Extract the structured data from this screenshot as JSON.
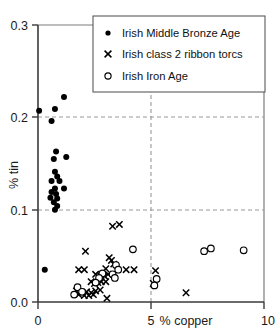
{
  "chart_data": {
    "type": "scatter",
    "title": "",
    "xlabel": "% copper",
    "ylabel": "% tin",
    "xlim": [
      0,
      10
    ],
    "ylim": [
      0.0,
      0.3
    ],
    "xticks": [
      0,
      5,
      10
    ],
    "xtick_labels": [
      "0",
      "5",
      "10"
    ],
    "yticks": [
      0.0,
      0.1,
      0.2,
      0.3
    ],
    "ytick_labels": [
      "0.0",
      "0.1",
      "0.2",
      "0.3"
    ],
    "grid": "dashed gridlines at y=0.1, y=0.2 and x=5",
    "legend_position": "top-center",
    "series": [
      {
        "name": "Irish Middle Bronze Age",
        "marker": "filled-circle",
        "color": "#000000",
        "points": [
          [
            0.05,
            0.207
          ],
          [
            0.6,
            0.196
          ],
          [
            0.75,
            0.209
          ],
          [
            1.15,
            0.222
          ],
          [
            0.8,
            0.163
          ],
          [
            0.7,
            0.155
          ],
          [
            1.25,
            0.157
          ],
          [
            0.75,
            0.141
          ],
          [
            0.85,
            0.136
          ],
          [
            0.6,
            0.131
          ],
          [
            0.95,
            0.131
          ],
          [
            0.75,
            0.123
          ],
          [
            1.15,
            0.123
          ],
          [
            0.6,
            0.119
          ],
          [
            0.8,
            0.117
          ],
          [
            0.85,
            0.112
          ],
          [
            0.55,
            0.113
          ],
          [
            0.7,
            0.108
          ],
          [
            0.85,
            0.104
          ],
          [
            0.75,
            0.1
          ],
          [
            0.3,
            0.035
          ]
        ]
      },
      {
        "name": "Irish class 2 ribbon torcs",
        "marker": "cross",
        "color": "#000000",
        "points": [
          [
            3.3,
            0.082
          ],
          [
            3.6,
            0.084
          ],
          [
            2.1,
            0.055
          ],
          [
            3.15,
            0.048
          ],
          [
            3.25,
            0.045
          ],
          [
            3.35,
            0.041
          ],
          [
            1.8,
            0.035
          ],
          [
            2.05,
            0.035
          ],
          [
            3.0,
            0.036
          ],
          [
            3.9,
            0.035
          ],
          [
            4.25,
            0.035
          ],
          [
            5.2,
            0.034
          ],
          [
            2.55,
            0.03
          ],
          [
            2.75,
            0.029
          ],
          [
            2.95,
            0.028
          ],
          [
            3.1,
            0.03
          ],
          [
            2.35,
            0.022
          ],
          [
            2.5,
            0.02
          ],
          [
            2.65,
            0.021
          ],
          [
            2.8,
            0.022
          ],
          [
            3.0,
            0.022
          ],
          [
            5.1,
            0.02
          ],
          [
            1.7,
            0.012
          ],
          [
            1.95,
            0.01
          ],
          [
            2.15,
            0.011
          ],
          [
            2.35,
            0.01
          ],
          [
            2.55,
            0.012
          ],
          [
            2.75,
            0.013
          ],
          [
            1.8,
            0.008
          ],
          [
            2.05,
            0.007
          ],
          [
            2.25,
            0.007
          ],
          [
            2.45,
            0.008
          ],
          [
            3.05,
            0.004
          ],
          [
            6.55,
            0.01
          ]
        ]
      },
      {
        "name": "Irish Iron Age",
        "marker": "open-circle",
        "color": "#000000",
        "points": [
          [
            4.2,
            0.057
          ],
          [
            7.35,
            0.055
          ],
          [
            7.65,
            0.058
          ],
          [
            9.1,
            0.056
          ],
          [
            3.45,
            0.04
          ],
          [
            3.55,
            0.035
          ],
          [
            2.85,
            0.031
          ],
          [
            3.3,
            0.03
          ],
          [
            2.7,
            0.026
          ],
          [
            3.4,
            0.026
          ],
          [
            5.25,
            0.025
          ],
          [
            2.55,
            0.021
          ],
          [
            5.15,
            0.018
          ],
          [
            1.75,
            0.016
          ],
          [
            1.95,
            0.011
          ],
          [
            1.6,
            0.008
          ]
        ]
      }
    ]
  },
  "legend": {
    "entries": [
      {
        "label": "Irish Middle Bronze Age",
        "marker": "filled-circle"
      },
      {
        "label": "Irish class 2 ribbon torcs",
        "marker": "cross"
      },
      {
        "label": "Irish Iron Age",
        "marker": "open-circle"
      }
    ]
  },
  "axes": {
    "x_title": "% copper",
    "y_title": "% tin",
    "x_labels": [
      "0",
      "5",
      "10"
    ],
    "y_labels": [
      "0.0",
      "0.1",
      "0.2",
      "0.3"
    ]
  }
}
